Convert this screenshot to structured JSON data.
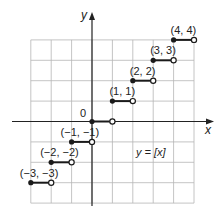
{
  "diagram": {
    "equation_label": "y = [x]",
    "x_axis_label": "x",
    "y_axis_label": "y",
    "origin_label": "0",
    "grid": {
      "x_min": -3,
      "x_max": 5,
      "y_min": -4,
      "y_max": 4,
      "origin_px": [
        92,
        121.5
      ],
      "unit_px": 20.4
    },
    "steps": [
      {
        "x": -3,
        "y": -3,
        "label": "(−3, −3)"
      },
      {
        "x": -2,
        "y": -2,
        "label": "(−2, −2)"
      },
      {
        "x": -1,
        "y": -1,
        "label": "(−1, −1)"
      },
      {
        "x": 0,
        "y": 0,
        "label": ""
      },
      {
        "x": 1,
        "y": 1,
        "label": "(1, 1)"
      },
      {
        "x": 2,
        "y": 2,
        "label": "(2, 2)"
      },
      {
        "x": 3,
        "y": 3,
        "label": "(3, 3)"
      },
      {
        "x": 4,
        "y": 4,
        "label": "(4, 4)"
      }
    ],
    "colors": {
      "grid": "#b5b5b5",
      "axis": "#222222",
      "step": "#1a1a1a"
    }
  }
}
